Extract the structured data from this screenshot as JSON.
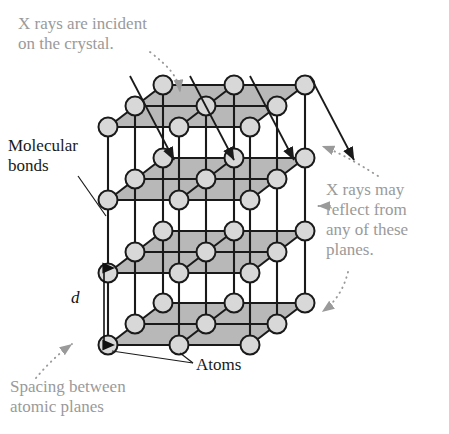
{
  "figure": {
    "colors": {
      "annotation_gray": "#9a9a9a",
      "label_black": "#1a1a1a",
      "atom_fill": "#d8d8d8",
      "atom_stroke": "#1a1a1a",
      "plane_fill": "#b8b8b8",
      "bond_stroke": "#1a1a1a",
      "background": "#ffffff"
    }
  },
  "annotations": {
    "xray_incident": "X rays are incident\non the crystal.",
    "molecular_bonds": "Molecular\nbonds",
    "xray_reflect": "X rays may\nreflect from\nany of these\nplanes.",
    "spacing_symbol": "d",
    "atoms": "Atoms",
    "spacing_between": "Spacing between\natomic planes"
  },
  "lattice": {
    "type": "cubic-lattice-oblique",
    "rows": 3,
    "cols": 3,
    "planes": 3,
    "origin_x": 108,
    "origin_y": 345,
    "step_x": 71,
    "step_y": 73,
    "depth_dx": 55,
    "depth_dy": -42,
    "atom_radius": 9.5
  },
  "xray_beams": {
    "count": 4,
    "angle_label": "incident",
    "starts_x": [
      130,
      190,
      250,
      310
    ],
    "start_y": 76,
    "length": 118,
    "dx": 44,
    "dy": 84
  },
  "dimension_arrow": {
    "label": "d",
    "x": 104,
    "y_top": 268,
    "y_bottom": 345
  }
}
